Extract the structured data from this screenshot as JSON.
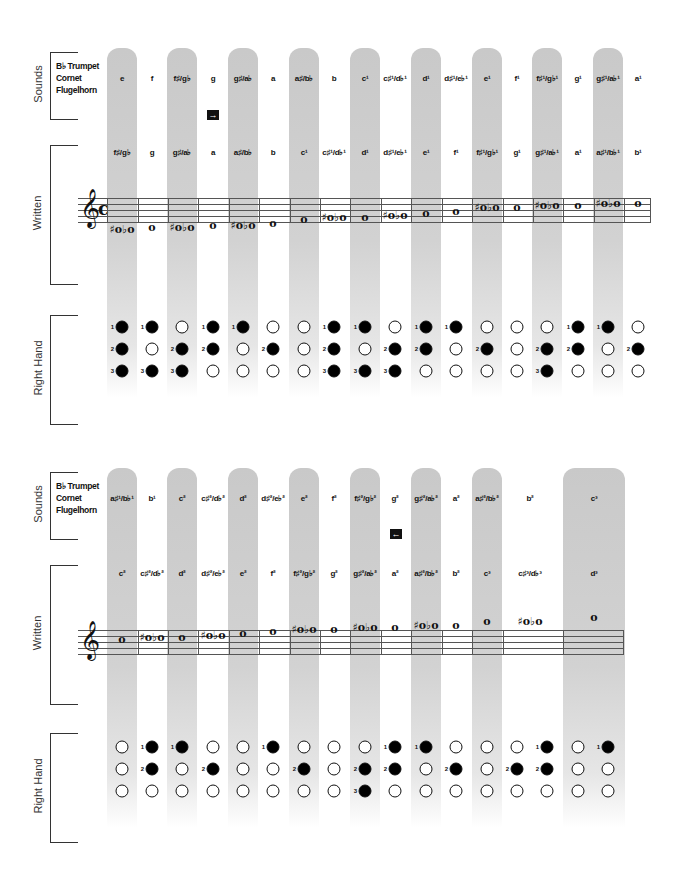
{
  "labels": {
    "sounds": "Sounds",
    "written": "Written",
    "right_hand": "Right Hand",
    "instruments": [
      "B♭ Trumpet",
      "Cornet",
      "Flugelhorn"
    ]
  },
  "icons": {
    "arrow_right": "→",
    "arrow_left": "←"
  },
  "colors": {
    "band_gray": "#c9c9c9",
    "pressed_valve": "#000000",
    "open_valve": "#ffffff",
    "text": "#111111"
  },
  "top": {
    "sounds": [
      "e",
      "f",
      "f♯/g♭",
      "g",
      "g♯/a♭",
      "a",
      "a♯/b♭",
      "b",
      "c¹",
      "c♯¹/d♭¹",
      "d¹",
      "d♯¹/e♭¹",
      "e¹",
      "f¹",
      "f♯¹/g♭¹",
      "g¹",
      "g♯¹/a♭¹",
      "a¹"
    ],
    "written": [
      "f♯/g♭",
      "g",
      "g♯/a♭",
      "a",
      "a♯/b♭",
      "b",
      "c¹",
      "c♯¹/d♭¹",
      "d¹",
      "d♯¹/e♭¹",
      "e¹",
      "f¹",
      "f♯¹/g♭¹",
      "g¹",
      "g♯¹/a♭¹",
      "a¹",
      "a♯¹/b♭¹",
      "b¹"
    ],
    "fingerings": [
      [
        1,
        2,
        3
      ],
      [
        1,
        3
      ],
      [
        2,
        3
      ],
      [
        1,
        2
      ],
      [
        1
      ],
      [
        2
      ],
      [],
      [
        1,
        2,
        3
      ],
      [
        1,
        3
      ],
      [
        2,
        3
      ],
      [
        1,
        2
      ],
      [
        1
      ],
      [
        2
      ],
      [],
      [
        2,
        3
      ],
      [
        1,
        2
      ],
      [
        1
      ],
      [
        2
      ]
    ]
  },
  "bottom": {
    "sounds": [
      "a♯¹/b♭¹",
      "b¹",
      "c²",
      "c♯²/d♭²",
      "d²",
      "d♯²/e♭²",
      "e²",
      "f²",
      "f♯²/g♭²",
      "g²",
      "g♯²/a♭²",
      "a²",
      "a♯²/b♭²",
      "b²",
      "c³"
    ],
    "written": [
      "c²",
      "c♯²/d♭²",
      "d²",
      "d♯²/e♭²",
      "e²",
      "f²",
      "f♯²/g♭²",
      "g²",
      "g♯²/a♭²",
      "a²",
      "a♯²/b♭²",
      "b²",
      "c³",
      "c♯³/d♭³",
      "d³"
    ],
    "fingerings": [
      [],
      [
        1,
        2
      ],
      [
        1
      ],
      [
        2
      ],
      [],
      [
        1
      ],
      [
        2
      ],
      [],
      [
        2,
        3
      ],
      [
        1,
        2
      ],
      [
        1
      ],
      [
        2
      ],
      [],
      [
        2
      ],
      [
        1,
        2
      ],
      [],
      [
        1
      ]
    ]
  }
}
